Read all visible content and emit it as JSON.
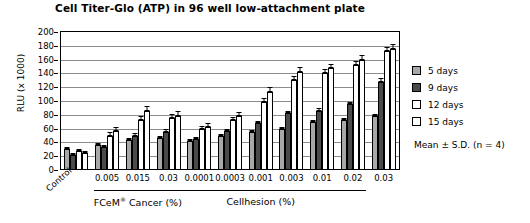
{
  "chart_data": {
    "type": "bar",
    "title": "Cell Titer-Glo (ATP) in 96 well low-attachment plate",
    "xlabel": "",
    "ylabel": "RLU (x 1000)",
    "ylim": [
      0,
      200
    ],
    "ytick_step": 20,
    "yticks": [
      0,
      20,
      40,
      60,
      80,
      100,
      120,
      140,
      160,
      180,
      200
    ],
    "grid": true,
    "legend_position": "right",
    "note": "Mean ± S.D. (n = 4)",
    "categories": [
      "Control",
      "0.005",
      "0.015",
      "0.03",
      "0.0001",
      "0.0003",
      "0.001",
      "0.003",
      "0.01",
      "0.02",
      "0.03"
    ],
    "category_groups": [
      {
        "name": "Control",
        "categories": [
          "Control"
        ]
      },
      {
        "name": "FCeM® Cancer (%)",
        "categories": [
          "0.005",
          "0.015",
          "0.03"
        ]
      },
      {
        "name": "Cellhesion (%)",
        "categories": [
          "0.0001",
          "0.0003",
          "0.001",
          "0.003",
          "0.01",
          "0.02",
          "0.03"
        ]
      }
    ],
    "series": [
      {
        "name": "5 days",
        "color": "#a8a8a8",
        "values": [
          30,
          36,
          44,
          46,
          42,
          49,
          55,
          60,
          70,
          72,
          78
        ],
        "errors": [
          2,
          2,
          3,
          3,
          2,
          3,
          3,
          3,
          3,
          3,
          3
        ]
      },
      {
        "name": "9 days",
        "color": "#4a4a4a",
        "values": [
          22,
          33,
          50,
          55,
          45,
          57,
          68,
          82,
          86,
          95,
          128
        ],
        "errors": [
          2,
          2,
          3,
          4,
          3,
          3,
          3,
          4,
          4,
          4,
          5
        ]
      },
      {
        "name": "12 days",
        "color": "#ffffff",
        "values": [
          28,
          50,
          73,
          75,
          60,
          72,
          98,
          130,
          140,
          152,
          172
        ],
        "errors": [
          3,
          5,
          6,
          6,
          4,
          5,
          6,
          6,
          6,
          6,
          7
        ]
      },
      {
        "name": "15 days",
        "color": "#ffffff",
        "values": [
          25,
          57,
          85,
          78,
          63,
          78,
          113,
          142,
          148,
          160,
          175
        ],
        "errors": [
          3,
          6,
          8,
          7,
          5,
          6,
          7,
          7,
          6,
          7,
          8
        ]
      }
    ]
  },
  "legend": {
    "items": [
      {
        "label": "5 days",
        "color": "#a8a8a8"
      },
      {
        "label": "9 days",
        "color": "#4a4a4a"
      },
      {
        "label": "12 days",
        "color": "#ffffff"
      },
      {
        "label": "15 days",
        "color": "#ffffff"
      }
    ],
    "note": "Mean ± S.D. (n = 4)"
  }
}
